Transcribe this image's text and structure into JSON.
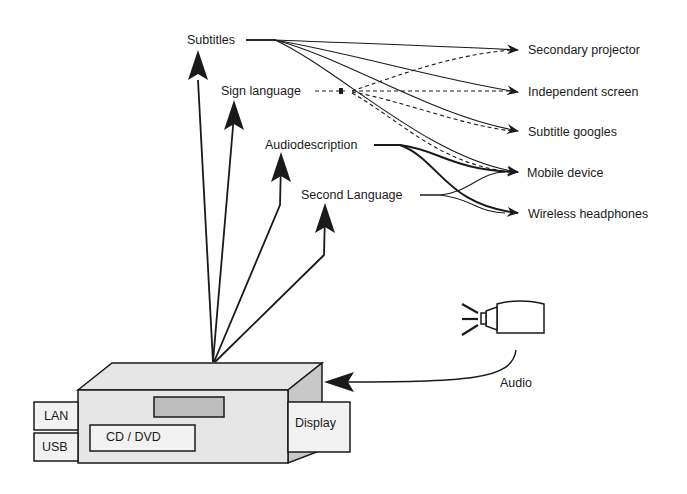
{
  "diagram": {
    "sources": {
      "subtitles": "Subtitles",
      "sign_language": "Sign language",
      "audiodescription": "Audiodescription",
      "second_language": "Second Language"
    },
    "outputs": {
      "secondary_projector": "Secondary projector",
      "independent_screen": "Independent screen",
      "subtitle_googles": "Subtitle googles",
      "mobile_device": "Mobile device",
      "wireless_headphones": "Wireless headphones"
    },
    "device": {
      "lan": "LAN",
      "usb": "USB",
      "cd_dvd": "CD / DVD",
      "display": "Display"
    },
    "audio_input": {
      "label": "Audio",
      "icon": "microphone-icon"
    },
    "colors": {
      "line": "#1a1a1a",
      "box_fill": "#e6e6e6",
      "box_side": "#c8c8c8",
      "slot_fill": "#bdbdbd",
      "panel_fill": "#f2f2f2"
    }
  }
}
